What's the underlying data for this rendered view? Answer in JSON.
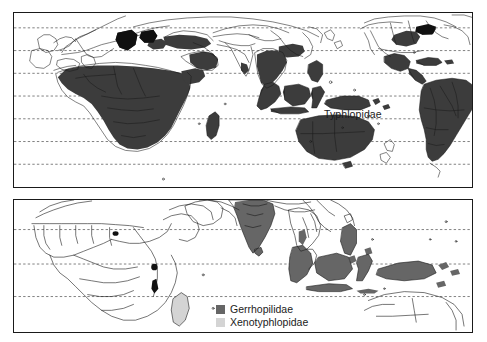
{
  "figure": {
    "type": "distribution-map",
    "panels": [
      {
        "id": "top",
        "label": "Typhlopidae",
        "label_x": 310,
        "label_y": 95,
        "projection": "equirectangular",
        "frame": {
          "x": 13,
          "y": 12,
          "w": 460,
          "h": 176
        },
        "gridlines_dashed": 7,
        "fill_color": "#3c3c3c",
        "outline_color": "#1a1a1a",
        "ocean_color": "#ffffff",
        "regions_shaded": [
          "Sub-Saharan Africa",
          "Madagascar",
          "Arabian Peninsula",
          "Levant / Turkey",
          "Libya / Egypt",
          "Southeast Asia",
          "Indonesia",
          "Philippines",
          "New Guinea",
          "Australia",
          "Southeastern United States",
          "Mexico",
          "Central America",
          "Caribbean",
          "South America"
        ]
      },
      {
        "id": "bottom",
        "label": "",
        "projection": "equirectangular",
        "frame": {
          "x": 13,
          "y": 199,
          "w": 460,
          "h": 134
        },
        "gridlines_dashed": 3,
        "regions_shaded_dark": [
          "Indian subcontinent",
          "Sri Lanka",
          "Philippines",
          "Borneo",
          "Sumatra",
          "Java",
          "Sulawesi",
          "New Guinea",
          "Bismarck Archipelago"
        ],
        "regions_shaded_light": [
          "Madagascar"
        ],
        "regions_black": [
          "Ghana / Togo coast",
          "Kenya highlands",
          "Malawi"
        ]
      }
    ]
  },
  "legend": {
    "position": "bottom-panel-center",
    "items": [
      {
        "label": "Gerrhopilidae",
        "color": "#666666"
      },
      {
        "label": "Xenotyphlopidae",
        "color": "#d4d4d4"
      }
    ]
  },
  "colors": {
    "dark_fill": "#3c3c3c",
    "mid_fill": "#666666",
    "light_fill": "#d4d4d4",
    "black_fill": "#101010",
    "outline": "#1a1a1a",
    "gridline": "#4a4a4a",
    "background": "#ffffff"
  }
}
